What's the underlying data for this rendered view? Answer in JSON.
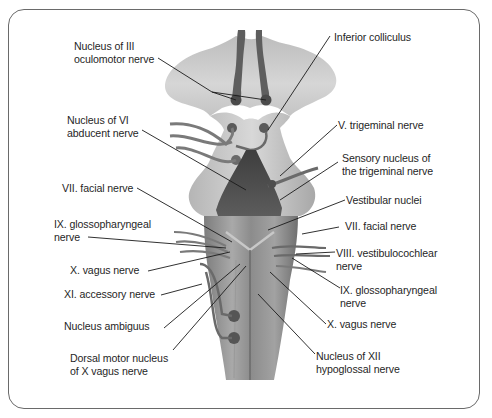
{
  "figure": {
    "colors": {
      "frame": "#6a6a6a",
      "tissue_light": "#c9c9c9",
      "tissue_mid": "#9c9c9c",
      "tissue_dark": "#555555",
      "nucleus": "#4a4a4a",
      "leader_line": "#1a1a1a",
      "text": "#1f1f1f"
    }
  },
  "labels": {
    "left": [
      {
        "id": "nucleus-iii",
        "text": "Nucleus of III\noculomotor nerve"
      },
      {
        "id": "nucleus-vi",
        "text": "Nucleus of VI\nabducent nerve"
      },
      {
        "id": "facial-left",
        "text": "VII. facial nerve"
      },
      {
        "id": "glosso-left",
        "text": "IX. glossopharyngeal\nnerve"
      },
      {
        "id": "vagus-left",
        "text": "X. vagus nerve"
      },
      {
        "id": "accessory",
        "text": "XI. accessory nerve"
      },
      {
        "id": "ambiguus",
        "text": "Nucleus ambiguus"
      },
      {
        "id": "dorsal-motor",
        "text": "Dorsal motor nucleus\nof X vagus nerve"
      }
    ],
    "right": [
      {
        "id": "inferior-colliculus",
        "text": "Inferior colliculus"
      },
      {
        "id": "trigeminal",
        "text": "V. trigeminal nerve"
      },
      {
        "id": "sensory-trigeminal",
        "text": "Sensory nucleus of\nthe trigeminal nerve"
      },
      {
        "id": "vestibular-nuclei",
        "text": "Vestibular nuclei"
      },
      {
        "id": "facial-right",
        "text": "VII. facial nerve"
      },
      {
        "id": "vestibulocochlear",
        "text": "VIII. vestibulocochlear\nnerve"
      },
      {
        "id": "glosso-right",
        "text": "IX. glossopharyngeal\nnerve"
      },
      {
        "id": "vagus-right",
        "text": "X. vagus nerve"
      },
      {
        "id": "nucleus-xii",
        "text": "Nucleus of XII\nhypoglossal nerve"
      }
    ]
  }
}
